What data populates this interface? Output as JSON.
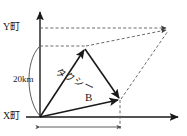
{
  "diagram": {
    "kind": "vector-parallelogram-diagram",
    "background_color": "#ffffff",
    "stroke_color": "#1a1a1a",
    "dashed_color": "#555555",
    "labels": {
      "y_town": "Y町",
      "x_town": "X町",
      "distance": "20km",
      "taxi": "タクシー",
      "vector_b": "B"
    },
    "axes": {
      "origin": {
        "x": 40,
        "y": 117
      },
      "y_axis_top": {
        "x": 40,
        "y": 10
      },
      "x_axis_right": {
        "x": 180,
        "y": 117
      }
    },
    "vectors": [
      {
        "name": "taxi-vector",
        "label": "タクシー",
        "from": {
          "x": 40,
          "y": 117
        },
        "to": {
          "x": 85,
          "y": 48
        },
        "style": "solid"
      },
      {
        "name": "b-vector",
        "label": "B",
        "from": {
          "x": 40,
          "y": 117
        },
        "to": {
          "x": 120,
          "y": 100
        },
        "style": "solid"
      },
      {
        "name": "resultant-component-vector",
        "label": "",
        "from": {
          "x": 85,
          "y": 48
        },
        "to": {
          "x": 120,
          "y": 100
        },
        "style": "solid"
      }
    ],
    "construction_lines": [
      {
        "name": "y-town-level-dashed",
        "from": {
          "x": 40,
          "y": 28
        },
        "to": {
          "x": 170,
          "y": 28
        },
        "style": "dashed"
      },
      {
        "name": "taxi-tip-level-dashed",
        "from": {
          "x": 40,
          "y": 46
        },
        "to": {
          "x": 170,
          "y": 30
        },
        "style": "dashed"
      },
      {
        "name": "b-tip-to-resultant-dashed",
        "from": {
          "x": 120,
          "y": 100
        },
        "to": {
          "x": 170,
          "y": 28
        },
        "style": "dashed"
      },
      {
        "name": "b-tip-vertical-dashed",
        "from": {
          "x": 120,
          "y": 100
        },
        "to": {
          "x": 120,
          "y": 128
        },
        "style": "dashed"
      }
    ],
    "dimensions": [
      {
        "name": "vertical-distance-arc",
        "label": "20km",
        "from": {
          "x": 40,
          "y": 117
        },
        "to": {
          "x": 40,
          "y": 46
        }
      },
      {
        "name": "horizontal-extent-dimension",
        "label": "",
        "from": {
          "x": 40,
          "y": 127
        },
        "to": {
          "x": 122,
          "y": 127
        }
      }
    ]
  }
}
